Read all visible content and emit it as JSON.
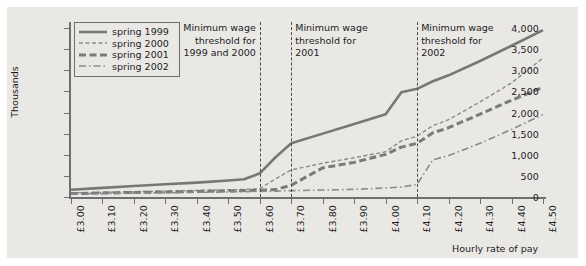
{
  "chart_data": {
    "type": "line",
    "title": "",
    "xlabel": "Hourly rate of pay",
    "ylabel": "Thousands",
    "ylim": [
      0,
      4000
    ],
    "xlim": [
      3.0,
      4.5
    ],
    "grid": false,
    "legend_position": "top-left",
    "ytick_labels": [
      "0",
      "500",
      "1,000",
      "1,500",
      "2,000",
      "2,500",
      "3,000",
      "3,500",
      "4,000"
    ],
    "ytick_values": [
      0,
      500,
      1000,
      1500,
      2000,
      2500,
      3000,
      3500,
      4000
    ],
    "xtick_labels": [
      "£3.00",
      "£3.10",
      "£3.20",
      "£3.30",
      "£3.40",
      "£3.50",
      "£3.60",
      "£3.70",
      "£3.80",
      "£3.90",
      "£4.00",
      "£4.10",
      "£4.20",
      "£4.30",
      "£4.40",
      "£4.50"
    ],
    "xtick_values": [
      3.0,
      3.1,
      3.2,
      3.3,
      3.4,
      3.5,
      3.6,
      3.7,
      3.8,
      3.9,
      4.0,
      4.1,
      4.2,
      4.3,
      4.4,
      4.5
    ],
    "x": [
      3.0,
      3.1,
      3.2,
      3.3,
      3.4,
      3.5,
      3.55,
      3.6,
      3.65,
      3.7,
      3.8,
      3.9,
      4.0,
      4.05,
      4.1,
      4.15,
      4.2,
      4.3,
      4.4,
      4.5
    ],
    "series": [
      {
        "name": "spring 1999",
        "style": "solid",
        "color": "#777777",
        "values": [
          170,
          215,
          260,
          300,
          340,
          390,
          420,
          560,
          940,
          1270,
          1500,
          1730,
          1960,
          2480,
          2560,
          2740,
          2880,
          3220,
          3580,
          3950
        ]
      },
      {
        "name": "spring 2000",
        "style": "dashed",
        "color": "#8a8a8a",
        "values": [
          95,
          110,
          125,
          140,
          155,
          170,
          180,
          195,
          430,
          640,
          800,
          930,
          1070,
          1330,
          1440,
          1690,
          1830,
          2250,
          2700,
          3290
        ]
      },
      {
        "name": "spring 2001",
        "style": "dash-long",
        "color": "#7a7a7a",
        "values": [
          80,
          95,
          108,
          120,
          132,
          145,
          152,
          162,
          175,
          280,
          690,
          820,
          1010,
          1180,
          1270,
          1520,
          1640,
          1960,
          2290,
          2600
        ]
      },
      {
        "name": "spring 2002",
        "style": "dash-dot",
        "color": "#8a8a8a",
        "values": [
          70,
          82,
          92,
          100,
          110,
          120,
          126,
          132,
          140,
          150,
          165,
          180,
          215,
          235,
          300,
          880,
          980,
          1270,
          1600,
          1950
        ]
      }
    ],
    "annotations": [
      {
        "label": "Minimum wage\nthreshold for\n1999 and 2000",
        "x": 3.6,
        "align": "right"
      },
      {
        "label": "Minimum wage\nthreshold for\n2001",
        "x": 3.7,
        "align": "left"
      },
      {
        "label": "Minimum wage\nthreshold for\n2002",
        "x": 4.1,
        "align": "left"
      }
    ]
  }
}
